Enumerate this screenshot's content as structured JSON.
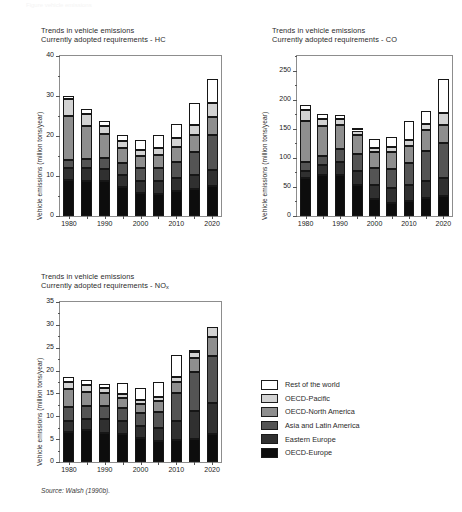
{
  "topnote": "Figure  vehicle emissions",
  "source": "Source: Walsh (1990b).",
  "axis_label": "Vehicle emissions (million tons/year)",
  "series": [
    {
      "key": "oecd_europe",
      "label": "OECD-Europe",
      "color": "#0d0d0d"
    },
    {
      "key": "eastern_europe",
      "label": "Eastern Europe",
      "color": "#303030"
    },
    {
      "key": "asia_latin",
      "label": "Asia and Latin America",
      "color": "#545454"
    },
    {
      "key": "oecd_north_america",
      "label": "OECD-North America",
      "color": "#8e8e8e"
    },
    {
      "key": "oecd_pacific",
      "label": "OECD-Pacific",
      "color": "#d2d2d2"
    },
    {
      "key": "rest_of_world",
      "label": "Rest of the world",
      "color": "#ffffff"
    }
  ],
  "legend": {
    "order_top_down": [
      "Rest of the world",
      "OECD-Pacific",
      "OECD-North America",
      "Asia and Latin America",
      "Eastern Europe",
      "OECD-Europe"
    ]
  },
  "chart_data": [
    {
      "id": "hc",
      "type": "bar",
      "stacked": true,
      "title": "Trends in vehicle emissions",
      "subtitle": "Currently adopted requirements - HC",
      "pollutant": "HC",
      "xlabel": "",
      "ylabel": "Vehicle emissions (million tons/year)",
      "ylim": [
        0,
        40
      ],
      "yticks": [
        0,
        10,
        20,
        30,
        40
      ],
      "yminor_step": 5,
      "grid": false,
      "x": [
        1980,
        1985,
        1990,
        1995,
        2000,
        2005,
        2010,
        2015,
        2020
      ],
      "categories": [
        "1980",
        "1985",
        "1990",
        "1995",
        "2000",
        "2005",
        "2010",
        "2015",
        "2020"
      ],
      "xtick_labels": [
        "1980",
        "",
        "1990",
        "",
        "2000",
        "",
        "2010",
        "",
        "2020"
      ],
      "series": [
        {
          "name": "OECD-Europe",
          "values": [
            9.0,
            8.8,
            8.7,
            7.2,
            5.7,
            5.6,
            6.3,
            6.7,
            7.5
          ]
        },
        {
          "name": "Eastern Europe",
          "values": [
            3.0,
            3.2,
            3.0,
            3.0,
            3.0,
            3.1,
            3.2,
            3.6,
            4.0
          ]
        },
        {
          "name": "Asia and Latin America",
          "values": [
            1.9,
            2.3,
            2.8,
            3.0,
            3.2,
            3.4,
            4.0,
            5.8,
            8.7
          ]
        },
        {
          "name": "OECD-North America",
          "values": [
            11.2,
            8.3,
            5.9,
            3.8,
            3.1,
            3.2,
            3.8,
            4.1,
            4.5
          ]
        },
        {
          "name": "OECD-Pacific",
          "values": [
            4.2,
            2.8,
            2.2,
            1.7,
            1.5,
            1.7,
            2.3,
            2.6,
            3.5
          ]
        },
        {
          "name": "Rest of the world",
          "values": [
            0.7,
            1.3,
            1.2,
            1.5,
            2.5,
            3.3,
            3.3,
            5.5,
            6.1
          ]
        }
      ],
      "totals": [
        30.0,
        26.7,
        23.8,
        20.2,
        19.0,
        20.3,
        22.9,
        28.3,
        34.3
      ]
    },
    {
      "id": "co",
      "type": "bar",
      "stacked": true,
      "title": "Trends in vehicle emissions",
      "subtitle": "Currently adopted requirements - CO",
      "pollutant": "CO",
      "xlabel": "",
      "ylabel": "Vehicle emissions (million tons/year)",
      "ylim": [
        0,
        275
      ],
      "yticks": [
        0,
        50,
        100,
        150,
        200,
        250
      ],
      "yminor_step": 25,
      "grid": false,
      "x": [
        1980,
        1985,
        1990,
        1995,
        2000,
        2005,
        2010,
        2015,
        2020
      ],
      "categories": [
        "1980",
        "1985",
        "1990",
        "1995",
        "2000",
        "2005",
        "2010",
        "2015",
        "2020"
      ],
      "xtick_labels": [
        "1980",
        "",
        "1990",
        "",
        "2000",
        "",
        "2010",
        "",
        "2020"
      ],
      "series": [
        {
          "name": "OECD-Europe",
          "values": [
            65,
            71,
            70,
            54,
            30,
            23,
            26,
            31,
            34
          ]
        },
        {
          "name": "Eastern Europe",
          "values": [
            13,
            17,
            23,
            24,
            24,
            25,
            27,
            29,
            31
          ]
        },
        {
          "name": "Asia and Latin America",
          "values": [
            15,
            16,
            22,
            28,
            29,
            33,
            38,
            51,
            60
          ]
        },
        {
          "name": "OECD-North America",
          "values": [
            70,
            50,
            42,
            33,
            27,
            29,
            30,
            36,
            32
          ]
        },
        {
          "name": "OECD-Pacific",
          "values": [
            19,
            12,
            10,
            8,
            7,
            8,
            9,
            12,
            20
          ]
        },
        {
          "name": "Rest of the world",
          "values": [
            9,
            10,
            6,
            5,
            16,
            17,
            33,
            22,
            58
          ]
        }
      ],
      "totals": [
        191,
        176,
        173,
        152,
        133,
        135,
        163,
        191,
        235
      ]
    },
    {
      "id": "nox",
      "type": "bar",
      "stacked": true,
      "title": "Trends in vehicle emissions",
      "subtitle": "Currently adopted requirements - NOx",
      "pollutant": "NOx",
      "xlabel": "",
      "ylabel": "Vehicle emissions (million tons/year)",
      "ylim": [
        0,
        35
      ],
      "yticks": [
        0,
        5,
        10,
        15,
        20,
        25,
        30,
        35
      ],
      "yminor_step": 2.5,
      "grid": false,
      "x": [
        1980,
        1985,
        1990,
        1995,
        2000,
        2005,
        2010,
        2015,
        2020
      ],
      "categories": [
        "1980",
        "1985",
        "1990",
        "1995",
        "2000",
        "2005",
        "2010",
        "2015",
        "2020"
      ],
      "xtick_labels": [
        "1980",
        "",
        "1990",
        "",
        "2000",
        "",
        "2010",
        "",
        "2020"
      ],
      "series": [
        {
          "name": "OECD-Europe",
          "values": [
            6.6,
            7.0,
            6.3,
            6.1,
            5.2,
            4.7,
            4.9,
            5.1,
            6.2
          ]
        },
        {
          "name": "Eastern Europe",
          "values": [
            2.3,
            2.4,
            3.2,
            2.9,
            2.6,
            2.8,
            4.1,
            6.0,
            6.8
          ]
        },
        {
          "name": "Asia and Latin America",
          "values": [
            3.1,
            2.9,
            2.8,
            2.9,
            2.9,
            3.4,
            6.0,
            8.6,
            10.3
          ]
        },
        {
          "name": "OECD-North America",
          "values": [
            4.0,
            3.0,
            2.7,
            2.0,
            1.9,
            2.4,
            2.6,
            3.1,
            4.1
          ]
        },
        {
          "name": "OECD-Pacific",
          "values": [
            1.6,
            1.5,
            1.1,
            1.0,
            0.9,
            1.0,
            1.0,
            1.2,
            2.2
          ]
        },
        {
          "name": "Rest of the world",
          "values": [
            1.1,
            1.2,
            0.9,
            2.3,
            2.6,
            3.3,
            4.9,
            0.6,
            0.0
          ]
        }
      ],
      "totals": [
        18.7,
        18.0,
        17.0,
        17.2,
        16.1,
        17.6,
        23.5,
        24.6,
        29.6
      ]
    }
  ]
}
